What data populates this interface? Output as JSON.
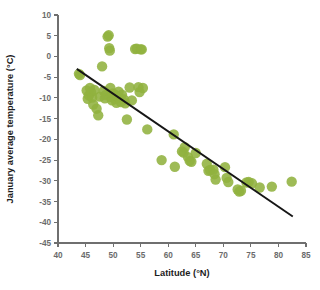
{
  "chart_data": {
    "type": "scatter",
    "title": "",
    "xlabel": "Latitude (°N)",
    "ylabel": "January average temperature (°C)",
    "xlim": [
      40,
      85
    ],
    "ylim": [
      -45,
      10
    ],
    "xticks": [
      40,
      45,
      50,
      55,
      60,
      65,
      70,
      75,
      80,
      85
    ],
    "yticks": [
      10,
      5,
      0,
      -5,
      -10,
      -15,
      -20,
      -25,
      -30,
      -35,
      -40,
      -45
    ],
    "xtick_labels": [
      "40",
      "45",
      "50",
      "55",
      "60",
      "65",
      "70",
      "75",
      "80",
      "85"
    ],
    "ytick_labels": [
      "10",
      "5",
      "0",
      "-5",
      "-10",
      "-15",
      "-20",
      "-25",
      "-30",
      "-35",
      "-40",
      "-45"
    ],
    "grid": false,
    "legend": null,
    "marker_color": "#91b23f",
    "marker_size": 5.2,
    "series": [
      {
        "name": "Stations",
        "points": [
          [
            43.8,
            -4.2
          ],
          [
            44.0,
            -4.5
          ],
          [
            45.2,
            -8.2
          ],
          [
            45.4,
            -10.2
          ],
          [
            45.6,
            -9.4
          ],
          [
            45.8,
            -7.6
          ],
          [
            46.0,
            -8.6
          ],
          [
            46.2,
            -9.9
          ],
          [
            46.4,
            -11.6
          ],
          [
            46.6,
            -8.1
          ],
          [
            47.0,
            -12.6
          ],
          [
            47.3,
            -14.2
          ],
          [
            47.6,
            -9.7
          ],
          [
            48.0,
            -2.4
          ],
          [
            48.3,
            -8.3
          ],
          [
            48.5,
            -10.1
          ],
          [
            48.7,
            -9.3
          ],
          [
            49.0,
            4.8
          ],
          [
            49.2,
            5.1
          ],
          [
            49.3,
            2.0
          ],
          [
            49.4,
            1.4
          ],
          [
            49.5,
            -7.6
          ],
          [
            49.6,
            -9.8
          ],
          [
            49.8,
            -10.6
          ],
          [
            49.9,
            -8.9
          ],
          [
            50.2,
            -9.1
          ],
          [
            50.4,
            -10.3
          ],
          [
            50.6,
            -11.2
          ],
          [
            50.8,
            -9.6
          ],
          [
            51.0,
            -8.5
          ],
          [
            51.2,
            -10.0
          ],
          [
            51.4,
            -11.0
          ],
          [
            51.6,
            -9.2
          ],
          [
            52.0,
            -10.4
          ],
          [
            52.2,
            -11.3
          ],
          [
            52.5,
            -15.2
          ],
          [
            53.0,
            -7.5
          ],
          [
            53.4,
            -10.6
          ],
          [
            54.0,
            1.8
          ],
          [
            54.3,
            1.9
          ],
          [
            55.0,
            1.7
          ],
          [
            55.2,
            1.7
          ],
          [
            54.6,
            -7.4
          ],
          [
            54.8,
            -8.6
          ],
          [
            55.4,
            -7.6
          ],
          [
            56.2,
            -17.6
          ],
          [
            58.8,
            -25.0
          ],
          [
            61.0,
            -18.8
          ],
          [
            61.2,
            -26.6
          ],
          [
            62.5,
            -22.9
          ],
          [
            62.8,
            -23.2
          ],
          [
            63.0,
            -21.9
          ],
          [
            63.6,
            -24.3
          ],
          [
            63.9,
            -25.2
          ],
          [
            64.2,
            -25.4
          ],
          [
            65.0,
            -23.3
          ],
          [
            67.0,
            -25.9
          ],
          [
            67.3,
            -27.6
          ],
          [
            67.6,
            -27.4
          ],
          [
            68.2,
            -27.3
          ],
          [
            68.4,
            -28.4
          ],
          [
            68.6,
            -29.7
          ],
          [
            70.3,
            -26.7
          ],
          [
            70.6,
            -29.3
          ],
          [
            70.9,
            -30.3
          ],
          [
            72.6,
            -32.1
          ],
          [
            72.9,
            -32.6
          ],
          [
            73.2,
            -32.4
          ],
          [
            74.2,
            -30.4
          ],
          [
            74.6,
            -30.3
          ],
          [
            75.2,
            -30.6
          ],
          [
            76.6,
            -31.6
          ],
          [
            78.8,
            -31.4
          ],
          [
            82.4,
            -30.2
          ]
        ]
      }
    ],
    "trend_line": {
      "x_start": 43.4,
      "y_start": -3.0,
      "x_end": 82.6,
      "y_end": -38.6,
      "color": "#161616"
    }
  }
}
